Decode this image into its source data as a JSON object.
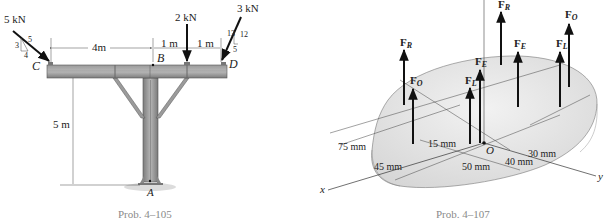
{
  "figures": [
    {
      "id": "prob-4-105",
      "caption": "Prob. 4–105",
      "loads": {
        "left": {
          "magnitude": "5 kN",
          "slope": {
            "hyp": "5",
            "rise": "3",
            "run": "4"
          }
        },
        "middle": {
          "magnitude": "2 kN"
        },
        "right": {
          "magnitude": "3 kN",
          "slope": {
            "hyp": "13",
            "rise": "12",
            "run": "5"
          }
        }
      },
      "points": {
        "c": "C",
        "b": "B",
        "d": "D",
        "a": "A"
      },
      "dimensions": {
        "cb": "4m",
        "b_mid": "1 m",
        "mid_d": "1 m",
        "height": "5 m"
      }
    },
    {
      "id": "prob-4-107",
      "caption": "Prob. 4–107",
      "forces": {
        "fr_top": {
          "letter": "F",
          "sub": "R"
        },
        "fr_left": {
          "letter": "F",
          "sub": "R"
        },
        "fo_left": {
          "letter": "F",
          "sub": "O"
        },
        "fe_left": {
          "letter": "F",
          "sub": "E"
        },
        "fl_left": {
          "letter": "F",
          "sub": "L"
        },
        "fe_right": {
          "letter": "F",
          "sub": "E"
        },
        "fl_right": {
          "letter": "F",
          "sub": "L"
        },
        "fo_right": {
          "letter": "F",
          "sub": "O"
        }
      },
      "origin": "O",
      "axes": {
        "x": "x",
        "y": "y"
      },
      "dimensions": {
        "d75": "75 mm",
        "d45": "45 mm",
        "d15": "15 mm",
        "d50": "50 mm",
        "d40": "40 mm",
        "d30": "30 mm"
      }
    }
  ]
}
